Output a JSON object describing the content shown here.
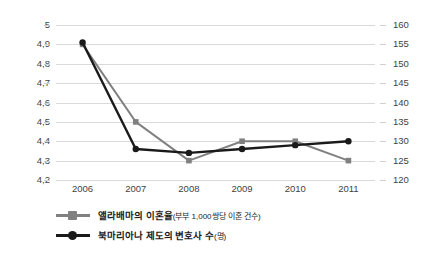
{
  "chart_data": {
    "type": "line",
    "title": "",
    "xlabel": "",
    "categories": [
      "2006",
      "2007",
      "2008",
      "2009",
      "2010",
      "2011"
    ],
    "grid": true,
    "legend_position": "bottom-left",
    "axes": {
      "left": {
        "label": "",
        "ylim": [
          4.2,
          5.0
        ],
        "ticks": [
          "5",
          "4,9",
          "4,8",
          "4,7",
          "4,6",
          "4,5",
          "4,4",
          "4,3",
          "4,2"
        ],
        "tick_values": [
          5.0,
          4.9,
          4.8,
          4.7,
          4.6,
          4.5,
          4.4,
          4.3,
          4.2
        ],
        "decimal_separator": ","
      },
      "right": {
        "label": "",
        "ylim": [
          120,
          160
        ],
        "ticks": [
          "160",
          "155",
          "150",
          "145",
          "140",
          "135",
          "130",
          "125",
          "120"
        ],
        "tick_values": [
          160,
          155,
          150,
          145,
          140,
          135,
          130,
          125,
          120
        ]
      }
    },
    "series": [
      {
        "name": "앨라배마의 이혼율",
        "name_sub": "(부부 1,000쌍당 이혼 건수)",
        "legend_label": "앨라배마의 이혼율(부부 1,000쌍당 이혼 건수)",
        "axis": "left",
        "color": "#808080",
        "marker": "square",
        "values": [
          4.9,
          4.5,
          4.3,
          4.4,
          4.4,
          4.3
        ]
      },
      {
        "name": "북마리아나 제도의 변호사 수",
        "name_sub": "(명)",
        "legend_label": "북마리아나 제도의 변호사 수(명)",
        "axis": "right",
        "color": "#1a1a1a",
        "marker": "circle",
        "values": [
          155.5,
          128.0,
          127.0,
          128.0,
          129.0,
          130.0
        ]
      }
    ]
  },
  "colors": {
    "gridline": "#d9d9d9",
    "text": "#3f3f3f",
    "series_gray": "#808080",
    "series_black": "#1a1a1a",
    "background": "#ffffff"
  }
}
